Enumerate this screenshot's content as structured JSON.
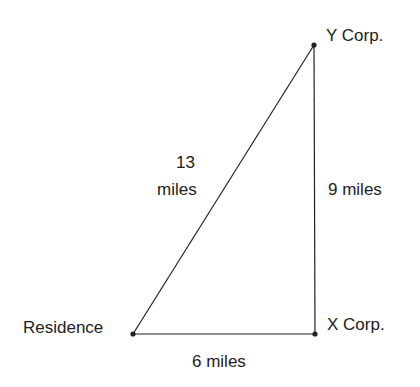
{
  "diagram": {
    "type": "right-triangle-distance",
    "points": {
      "residence": {
        "label": "Residence",
        "x": 133,
        "y": 334
      },
      "x_corp": {
        "label": "X Corp.",
        "x": 315,
        "y": 334
      },
      "y_corp": {
        "label": "Y Corp.",
        "x": 314,
        "y": 45
      }
    },
    "edges": {
      "hypotenuse": {
        "label_line1": "13",
        "label_line2": "miles"
      },
      "vertical": {
        "label": "9 miles"
      },
      "horizontal": {
        "label": "6 miles"
      }
    },
    "line_color": "#222222"
  }
}
